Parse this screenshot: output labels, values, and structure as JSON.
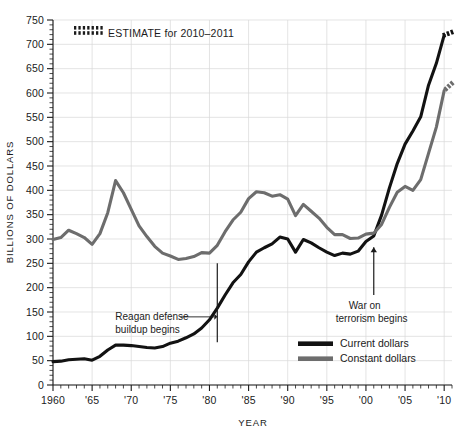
{
  "chart_data": {
    "type": "line",
    "title": "",
    "xlabel": "YEAR",
    "ylabel": "BILLIONS OF DOLLARS",
    "xlim": [
      1960,
      2011
    ],
    "ylim": [
      0,
      750
    ],
    "ytick_step": 50,
    "yminor_step": 10,
    "xtick_step": 5,
    "grid": true,
    "legend_position": "inside-bottom-right",
    "ytick_labels": [
      "0",
      "50",
      "100",
      "150",
      "200",
      "250",
      "300",
      "350",
      "400",
      "450",
      "500",
      "550",
      "600",
      "650",
      "700",
      "750"
    ],
    "xtick_labels": [
      "1960",
      "'65",
      "'70",
      "'75",
      "'80",
      "'85",
      "'90",
      "'95",
      "'00",
      "'05",
      "'10"
    ],
    "xtick_values": [
      1960,
      1965,
      1970,
      1975,
      1980,
      1985,
      1990,
      1995,
      2000,
      2005,
      2010
    ],
    "colors": {
      "current": "#121212",
      "constant": "#6d6d6d",
      "grid": "#d8d8d8",
      "axis": "#1b1b1b"
    },
    "x": [
      1960,
      1961,
      1962,
      1963,
      1964,
      1965,
      1966,
      1967,
      1968,
      1969,
      1970,
      1971,
      1972,
      1973,
      1974,
      1975,
      1976,
      1977,
      1978,
      1979,
      1980,
      1981,
      1982,
      1983,
      1984,
      1985,
      1986,
      1987,
      1988,
      1989,
      1990,
      1991,
      1992,
      1993,
      1994,
      1995,
      1996,
      1997,
      1998,
      1999,
      2000,
      2001,
      2002,
      2003,
      2004,
      2005,
      2006,
      2007,
      2008,
      2009,
      2010,
      2011
    ],
    "series": [
      {
        "name": "Current dollars",
        "color": "#121212",
        "values": [
          48,
          49,
          52,
          53,
          54,
          51,
          59,
          72,
          82,
          82,
          81,
          79,
          77,
          76,
          79,
          86,
          90,
          97,
          105,
          117,
          134,
          158,
          185,
          210,
          227,
          253,
          273,
          282,
          290,
          304,
          300,
          273,
          299,
          292,
          282,
          273,
          266,
          271,
          269,
          275,
          295,
          306,
          349,
          405,
          455,
          495,
          522,
          551,
          616,
          661,
          719,
          725
        ],
        "estimate_from": 2010
      },
      {
        "name": "Constant dollars",
        "color": "#6d6d6d",
        "values": [
          299,
          303,
          318,
          311,
          303,
          289,
          311,
          354,
          420,
          395,
          361,
          327,
          305,
          285,
          271,
          265,
          258,
          260,
          264,
          272,
          271,
          287,
          315,
          339,
          355,
          383,
          397,
          395,
          388,
          391,
          382,
          348,
          371,
          357,
          343,
          324,
          309,
          309,
          301,
          302,
          310,
          312,
          330,
          365,
          396,
          408,
          400,
          422,
          476,
          530,
          605,
          620
        ],
        "estimate_from": 2010
      }
    ],
    "annotations": [
      {
        "name": "reagan-buildup",
        "text_line1": "Reagan defense",
        "text_line2": "buildup begins",
        "year": 1981,
        "style": "vertical-line-with-leader"
      },
      {
        "name": "war-on-terrorism",
        "text_line1": "War on",
        "text_line2": "terrorism begins",
        "year": 2001,
        "style": "up-arrow"
      }
    ],
    "estimate_note": {
      "label": "ESTIMATE for 2010–2011",
      "marker": "hatched-swatch"
    },
    "legend": [
      {
        "label": "Current dollars",
        "color": "#121212",
        "swatch": "thick-line-black"
      },
      {
        "label": "Constant dollars",
        "color": "#6d6d6d",
        "swatch": "thick-line-gray"
      }
    ]
  }
}
